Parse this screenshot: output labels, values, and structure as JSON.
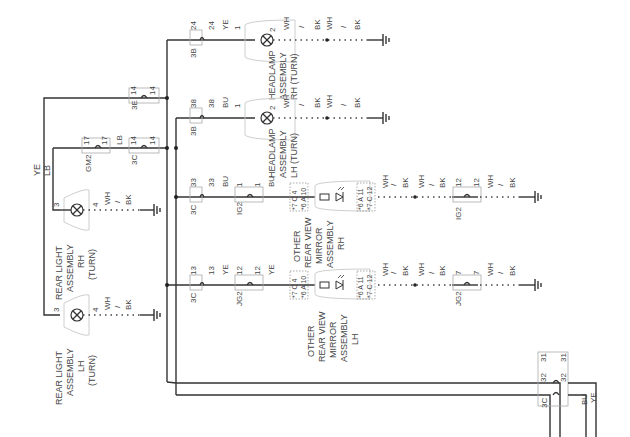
{
  "diagram": {
    "type": "wiring-schematic",
    "orientation": "rotated-90",
    "trunk_wire_colors": [
      "YE",
      "LB"
    ],
    "components": {
      "headlamp_rh": {
        "lines": [
          "HEADLAMP",
          "ASSEMBLY",
          "RH (TURN)"
        ],
        "pin_in": "1",
        "pin_out": "2",
        "connector": "3B",
        "pins": [
          "24",
          "24"
        ],
        "wire_color": "YE"
      },
      "headlamp_lh": {
        "lines": [
          "HEADLAMP",
          "ASSEMBLY",
          "LH (TURN)"
        ],
        "pin_in": "1",
        "pin_out": "2",
        "connector": "3B",
        "pins": [
          "38",
          "38"
        ],
        "wire_color": "BU"
      },
      "mirror_rh": {
        "lines": [
          "OTHER",
          "REAR VIEW",
          "MIRROR",
          "ASSEMBLY",
          "RH"
        ],
        "conn_in": [
          "*7 C 4",
          "*6 A 10"
        ],
        "conn_out": [
          "*6 A 11",
          "*7 C 12"
        ]
      },
      "mirror_lh": {
        "lines": [
          "OTHER",
          "REAR VIEW",
          "MIRROR",
          "ASSEMBLY",
          "LH"
        ],
        "conn_in": [
          "*7 C 4",
          "*6 A 10"
        ],
        "conn_out": [
          "*6 A 11",
          "*7 C 12"
        ]
      },
      "rear_light_rh": {
        "lines": [
          "REAR LIGHT",
          "ASSEMBLY",
          "RH",
          "(TURN)"
        ],
        "pin_in": "3",
        "pin_out": "4"
      },
      "rear_light_lh": {
        "lines": [
          "REAR LIGHT",
          "ASSEMBLY",
          "LH",
          "(TURN)"
        ],
        "pin_in": "3",
        "pin_out": "4"
      }
    },
    "connectors": {
      "c3e": {
        "label": "3E",
        "pins": [
          "14",
          "14"
        ]
      },
      "c3c_14": {
        "label": "3C",
        "pins": [
          "14",
          "14"
        ]
      },
      "gm2": {
        "label": "GM2",
        "pins": [
          "17",
          "17"
        ],
        "wire_color": "LB"
      },
      "c3c_33": {
        "label": "3C",
        "pins": [
          "33",
          "33"
        ],
        "wire_color": "BU"
      },
      "ig2_1": {
        "label": "IG2",
        "pins": [
          "1",
          "1"
        ],
        "wire_color": "BU"
      },
      "ig2_12": {
        "label": "IG2",
        "pins": [
          "12",
          "12"
        ]
      },
      "c3c_13": {
        "label": "3C",
        "pins": [
          "13",
          "13"
        ],
        "wire_color": "YE"
      },
      "jg2_12": {
        "label": "JG2",
        "pins": [
          "12",
          "12"
        ],
        "wire_color": "YE"
      },
      "jg2_7": {
        "label": "JG2",
        "pins": [
          "7",
          "7"
        ]
      },
      "c3c_bottom": {
        "label": "3C",
        "pins_top": [
          "31",
          "31"
        ],
        "pins_bottom": [
          "32",
          "32"
        ]
      }
    },
    "ground_wire": {
      "a": "WH",
      "sep": "/",
      "b": "BK"
    },
    "exit_wire_colors": [
      "BU",
      "YE"
    ]
  }
}
